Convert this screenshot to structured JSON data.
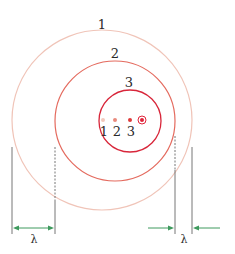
{
  "diagram": {
    "colors": {
      "circle_1": "#f0c4b8",
      "circle_2": "#e46a5e",
      "circle_3": "#d8263a",
      "dot_1": "#f2c8bc",
      "dot_2": "#e98a7c",
      "dot_3": "#e03a3a",
      "source": "#e0243a",
      "guide_line": "#777777",
      "arrow": "#3f9a5e",
      "text": "#2a2a2a"
    },
    "wavefronts": [
      {
        "label": "1",
        "cx": 102,
        "cy": 120,
        "r": 90
      },
      {
        "label": "2",
        "cx": 115,
        "cy": 121,
        "r": 60
      },
      {
        "label": "3",
        "cx": 130,
        "cy": 121,
        "r": 31
      }
    ],
    "emission_points": [
      {
        "label": "1",
        "x": 103,
        "y": 120
      },
      {
        "label": "2",
        "x": 115,
        "y": 120
      },
      {
        "label": "3",
        "x": 130,
        "y": 120
      }
    ],
    "source": {
      "x": 142,
      "y": 120
    },
    "wavelength_left": {
      "label": "λ",
      "description": "longer wavelength behind source"
    },
    "wavelength_right": {
      "label": "λ",
      "description": "shorter wavelength ahead of source"
    }
  }
}
